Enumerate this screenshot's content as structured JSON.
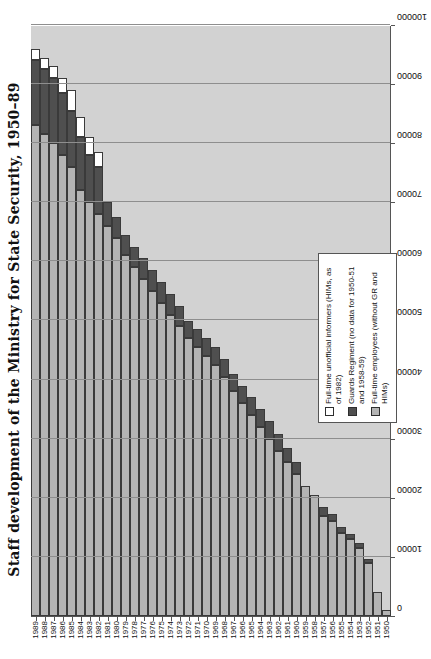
{
  "chart_data": {
    "type": "bar",
    "orientation": "horizontal",
    "stacked": true,
    "title": "Staff development of the Ministry for State Security, 1950–89",
    "xlabel": "",
    "ylabel": "",
    "xlim": [
      0,
      100000
    ],
    "xticks": [
      0,
      10000,
      20000,
      30000,
      40000,
      50000,
      60000,
      70000,
      80000,
      90000,
      100000
    ],
    "xtick_labels": [
      "0",
      "10000",
      "20000",
      "30000",
      "40000",
      "50000",
      "60000",
      "70000",
      "80000",
      "90000",
      "100000"
    ],
    "grid": true,
    "legend_position": "inside-lower-left",
    "categories": [
      "1989",
      "1988",
      "1987",
      "1986",
      "1985",
      "1984",
      "1983",
      "1982",
      "1981",
      "1980",
      "1979",
      "1978",
      "1977",
      "1976",
      "1975",
      "1974",
      "1973",
      "1972",
      "1971",
      "1970",
      "1969",
      "1968",
      "1967",
      "1966",
      "1965",
      "1964",
      "1963",
      "1962",
      "1961",
      "1960",
      "1959",
      "1958",
      "1957",
      "1956",
      "1955",
      "1954",
      "1953",
      "1952",
      "1951",
      "1950"
    ],
    "series": [
      {
        "name": "Full-time employees (without GR and HIMs)",
        "color": "#b4b4b4",
        "values": [
          83000,
          81500,
          80000,
          78000,
          76000,
          72000,
          70000,
          68000,
          66000,
          64000,
          61000,
          59000,
          57000,
          55000,
          53000,
          51000,
          49000,
          47000,
          45500,
          44000,
          42500,
          40500,
          38000,
          36000,
          34000,
          32000,
          30000,
          28000,
          26000,
          24000,
          22000,
          20500,
          17000,
          16000,
          14000,
          13000,
          11500,
          9000,
          4000,
          1000
        ]
      },
      {
        "name": "Guards Regiment (no data for 1950–51 and 1958–59)",
        "color": "#4f4f4f",
        "values": [
          11000,
          11000,
          11000,
          10500,
          9500,
          9000,
          8000,
          8000,
          4000,
          3500,
          3500,
          3500,
          3500,
          3500,
          3500,
          3500,
          3500,
          3000,
          3000,
          3000,
          3000,
          3000,
          3000,
          3000,
          3000,
          3000,
          3000,
          2800,
          2500,
          2000,
          0,
          0,
          1500,
          1200,
          1000,
          900,
          800,
          700,
          0,
          0
        ]
      },
      {
        "name": "Full-time unofficial informers (HIMs, as of 1982)",
        "color": "#ffffff",
        "values": [
          2000,
          2000,
          2000,
          2500,
          3500,
          3500,
          3000,
          2500,
          0,
          0,
          0,
          0,
          0,
          0,
          0,
          0,
          0,
          0,
          0,
          0,
          0,
          0,
          0,
          0,
          0,
          0,
          0,
          0,
          0,
          0,
          0,
          0,
          0,
          0,
          0,
          0,
          0,
          0,
          0,
          0
        ]
      }
    ],
    "legend": [
      "Full-time unofficial informers (HIMs, as of 1982)",
      "Guards Regiment (no data for 1950-51 and 1958-59)",
      "Full-time employees (without GR and HIMs)"
    ]
  }
}
